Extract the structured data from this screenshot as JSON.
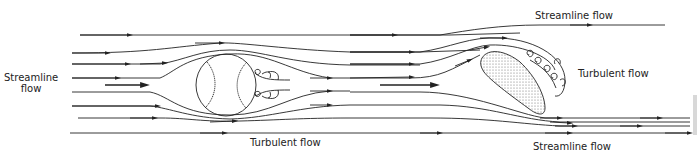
{
  "diagram": {
    "labels": {
      "left_streamline_line1": "Streamline",
      "left_streamline_line2": "flow",
      "ball_turbulent": "Turbulent flow",
      "top_streamline": "Streamline flow",
      "airfoil_turbulent": "Turbulent flow",
      "bottom_streamline": "Streamline flow"
    },
    "objects": [
      "baseball",
      "tilted-airfoil"
    ],
    "colors": {
      "line": "#222222",
      "background": "#ffffff"
    }
  }
}
